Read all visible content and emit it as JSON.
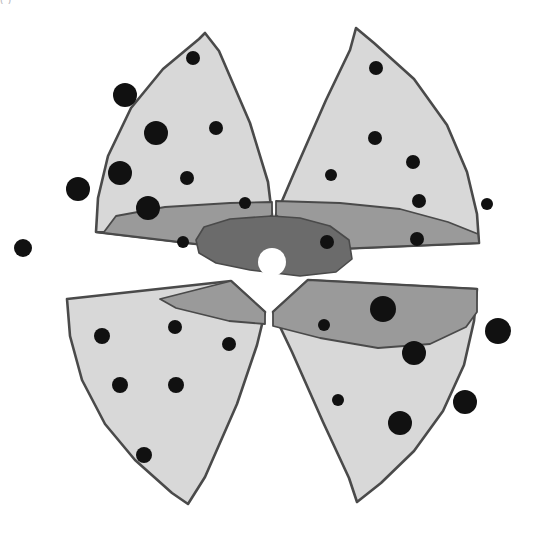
{
  "figure": {
    "caption_sliver": "(                                   )",
    "background_color": "#ffffff"
  },
  "palette": {
    "outline": "#4a4a4a",
    "petal_light_gray": "#d8d8d8",
    "band_medium_gray": "#9a9a9a",
    "core_dark_gray": "#6b6b6b",
    "dot_black": "#111111",
    "center_white": "#ffffff"
  },
  "legend_zones": [
    {
      "name": "outer-zone",
      "label": "outer sector",
      "fill": "#d8d8d8"
    },
    {
      "name": "middle-zone",
      "label": "middle band",
      "fill": "#9a9a9a"
    },
    {
      "name": "inner-zone",
      "label": "inner core",
      "fill": "#6b6b6b"
    },
    {
      "name": "center-void",
      "label": "center void",
      "fill": "#ffffff"
    }
  ],
  "chart_data": {
    "type": "scatter",
    "xlabel": "",
    "ylabel": "",
    "xlim": [
      0,
      545
    ],
    "ylim": [
      0,
      539
    ],
    "grid": false,
    "legend_position": "none",
    "center": {
      "x": 272,
      "y": 262,
      "r": 14,
      "fill": "#ffffff"
    },
    "sectors": [
      {
        "name": "top-left-sector",
        "quadrant": "top-left",
        "fill": "#d8d8d8",
        "path": "M 272,215 L 238,249 L 96,232 L 98,198 L 108,156 L 131,108 L 163,69 L 199,39 L 205,33 L 219,51 L 250,123 L 268,182 Z"
      },
      {
        "name": "top-right-sector",
        "quadrant": "top-right",
        "fill": "#d8d8d8",
        "path": "M 276,215 L 294,173 L 326,100 L 350,50 L 356,28 L 374,43 L 414,79 L 447,125 L 467,172 L 477,214 L 479,243 L 312,250 Z"
      },
      {
        "name": "bottom-left-sector",
        "quadrant": "bottom-left",
        "fill": "#d8d8d8",
        "path": "M 265,312 L 231,281 L 67,299 L 70,336 L 82,380 L 105,424 L 135,460 L 172,493 L 188,504 L 205,477 L 237,404 L 257,345 Z"
      },
      {
        "name": "bottom-right-sector",
        "quadrant": "bottom-right",
        "fill": "#d8d8d8",
        "path": "M 273,312 L 292,352 L 323,422 L 349,478 L 357,502 L 381,483 L 414,451 L 443,411 L 464,365 L 474,321 L 477,289 L 308,280 Z"
      }
    ],
    "bands": [
      {
        "name": "upper-middle-band",
        "fill": "#9a9a9a",
        "path": "M 104,232 L 116,216 L 165,207 L 230,203 L 272,202 L 272,215 L 238,249 L 96,232 Z"
      },
      {
        "name": "upper-right-middle-band",
        "fill": "#9a9a9a",
        "path": "M 276,215 L 276,201 L 340,203 L 400,209 L 448,222 L 478,234 L 479,243 L 312,250 Z"
      },
      {
        "name": "lower-left-middle-band",
        "fill": "#9a9a9a",
        "path": "M 265,312 L 265,324 L 229,321 L 176,308 L 160,299 L 231,281 Z"
      },
      {
        "name": "lower-right-middle-band",
        "fill": "#9a9a9a",
        "path": "M 273,312 L 273,326 L 320,338 L 378,348 L 430,344 L 466,327 L 477,312 L 477,289 L 308,280 Z"
      }
    ],
    "core": {
      "name": "inner-core-blob",
      "fill": "#6b6b6b",
      "path": "M 272,216 L 230,219 L 204,227 L 196,240 L 199,253 L 216,263 L 250,270 L 300,276 L 336,272 L 352,259 L 349,240 L 330,226 L 300,218 Z"
    },
    "dots": [
      {
        "sector": "top-left-sector",
        "cx": 193,
        "cy": 58,
        "r": 7,
        "size": "small"
      },
      {
        "sector": "top-left-sector",
        "cx": 125,
        "cy": 95,
        "r": 12,
        "size": "large"
      },
      {
        "sector": "top-left-sector",
        "cx": 156,
        "cy": 133,
        "r": 12,
        "size": "large"
      },
      {
        "sector": "top-left-sector",
        "cx": 216,
        "cy": 128,
        "r": 7,
        "size": "small"
      },
      {
        "sector": "top-left-sector",
        "cx": 120,
        "cy": 173,
        "r": 12,
        "size": "large"
      },
      {
        "sector": "top-left-sector",
        "cx": 78,
        "cy": 189,
        "r": 12,
        "size": "large"
      },
      {
        "sector": "top-left-sector",
        "cx": 187,
        "cy": 178,
        "r": 7,
        "size": "small"
      },
      {
        "sector": "top-left-sector",
        "cx": 148,
        "cy": 208,
        "r": 12,
        "size": "large"
      },
      {
        "sector": "top-left-sector",
        "cx": 245,
        "cy": 203,
        "r": 6,
        "size": "small"
      },
      {
        "sector": "top-left-sector",
        "cx": 183,
        "cy": 242,
        "r": 6,
        "size": "small"
      },
      {
        "sector": "top-left-sector",
        "cx": 23,
        "cy": 248,
        "r": 9,
        "size": "medium"
      },
      {
        "sector": "top-right-sector",
        "cx": 376,
        "cy": 68,
        "r": 7,
        "size": "small"
      },
      {
        "sector": "top-right-sector",
        "cx": 375,
        "cy": 138,
        "r": 7,
        "size": "small"
      },
      {
        "sector": "top-right-sector",
        "cx": 413,
        "cy": 162,
        "r": 7,
        "size": "small"
      },
      {
        "sector": "top-right-sector",
        "cx": 331,
        "cy": 175,
        "r": 6,
        "size": "small"
      },
      {
        "sector": "top-right-sector",
        "cx": 419,
        "cy": 201,
        "r": 7,
        "size": "small"
      },
      {
        "sector": "top-right-sector",
        "cx": 487,
        "cy": 204,
        "r": 6,
        "size": "small"
      },
      {
        "sector": "top-right-sector",
        "cx": 417,
        "cy": 239,
        "r": 7,
        "size": "small"
      },
      {
        "sector": "top-right-sector",
        "cx": 327,
        "cy": 242,
        "r": 7,
        "size": "small"
      },
      {
        "sector": "bottom-left-sector",
        "cx": 102,
        "cy": 336,
        "r": 8,
        "size": "medium"
      },
      {
        "sector": "bottom-left-sector",
        "cx": 175,
        "cy": 327,
        "r": 7,
        "size": "small"
      },
      {
        "sector": "bottom-left-sector",
        "cx": 229,
        "cy": 344,
        "r": 7,
        "size": "small"
      },
      {
        "sector": "bottom-left-sector",
        "cx": 120,
        "cy": 385,
        "r": 8,
        "size": "medium"
      },
      {
        "sector": "bottom-left-sector",
        "cx": 176,
        "cy": 385,
        "r": 8,
        "size": "medium"
      },
      {
        "sector": "bottom-left-sector",
        "cx": 144,
        "cy": 455,
        "r": 8,
        "size": "medium"
      },
      {
        "sector": "bottom-right-sector",
        "cx": 383,
        "cy": 309,
        "r": 13,
        "size": "large"
      },
      {
        "sector": "bottom-right-sector",
        "cx": 324,
        "cy": 325,
        "r": 6,
        "size": "small"
      },
      {
        "sector": "bottom-right-sector",
        "cx": 498,
        "cy": 331,
        "r": 13,
        "size": "large"
      },
      {
        "sector": "bottom-right-sector",
        "cx": 414,
        "cy": 353,
        "r": 12,
        "size": "large"
      },
      {
        "sector": "bottom-right-sector",
        "cx": 338,
        "cy": 400,
        "r": 6,
        "size": "small"
      },
      {
        "sector": "bottom-right-sector",
        "cx": 465,
        "cy": 402,
        "r": 12,
        "size": "large"
      },
      {
        "sector": "bottom-right-sector",
        "cx": 400,
        "cy": 423,
        "r": 12,
        "size": "large"
      },
      {
        "sector": "bottom-right-sector",
        "cx": 458,
        "cy": 362,
        "r": 0,
        "size": "none"
      }
    ],
    "dot_size_counts": {
      "small": 17,
      "medium": 6,
      "large": 11,
      "total": 34
    }
  }
}
